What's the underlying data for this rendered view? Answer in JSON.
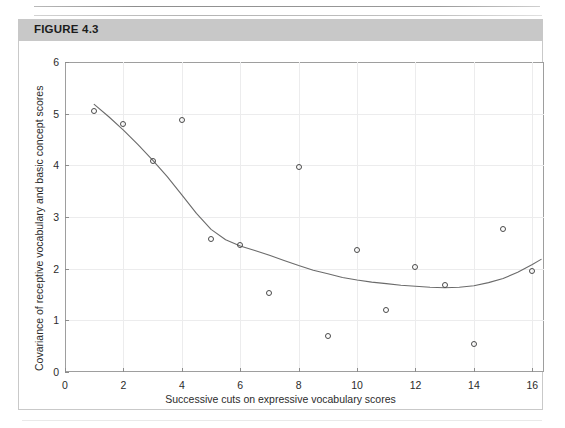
{
  "figure": {
    "label": "FIGURE 4.3",
    "band_color": "#c8c8c8"
  },
  "chart_data": {
    "type": "scatter",
    "title": "FIGURE 4.3",
    "xlabel": "Successive cuts on expressive vocabulary scores",
    "ylabel": "Covariance of receptive vocabulary and basic concept scores",
    "xlim": [
      0,
      16.4
    ],
    "ylim": [
      0,
      6
    ],
    "xticks": [
      0,
      2,
      4,
      6,
      8,
      10,
      12,
      14,
      16
    ],
    "xtick_labels": [
      "0",
      "2",
      "4",
      "6",
      "8",
      "10",
      "12",
      "14",
      "16"
    ],
    "yticks": [
      0,
      1,
      2,
      3,
      4,
      5,
      6
    ],
    "ytick_labels": [
      "0",
      "1",
      "2",
      "3",
      "4",
      "5",
      "6"
    ],
    "grid": true,
    "legend": null,
    "marker": "open-circle",
    "marker_color": "#4a4a4a",
    "line_color": "#6b6b6b",
    "x": [
      1,
      2,
      3,
      4,
      5,
      6,
      7,
      8,
      9,
      10,
      11,
      12,
      13,
      14,
      15,
      16
    ],
    "values": [
      5.05,
      4.8,
      4.08,
      4.87,
      2.58,
      2.45,
      1.52,
      3.97,
      0.7,
      2.37,
      1.2,
      2.03,
      1.68,
      0.55,
      2.77,
      1.95
    ],
    "series": [
      {
        "name": "Covariance by successive cut",
        "values": [
          5.05,
          4.8,
          4.08,
          4.87,
          2.58,
          2.45,
          1.52,
          3.97,
          0.7,
          2.37,
          1.2,
          2.03,
          1.68,
          0.55,
          2.77,
          1.95
        ]
      },
      {
        "name": "Smoothed fit",
        "type": "line",
        "x": [
          1.0,
          1.5,
          2.0,
          2.5,
          3.0,
          3.5,
          4.0,
          4.5,
          5.0,
          5.5,
          6.0,
          6.5,
          7.0,
          7.5,
          8.0,
          8.5,
          9.0,
          9.5,
          10.0,
          10.5,
          11.0,
          11.5,
          12.0,
          12.5,
          13.0,
          13.5,
          14.0,
          14.5,
          15.0,
          15.5,
          16.0,
          16.3
        ],
        "values": [
          5.18,
          4.94,
          4.68,
          4.4,
          4.1,
          3.78,
          3.43,
          3.07,
          2.76,
          2.56,
          2.44,
          2.35,
          2.26,
          2.16,
          2.06,
          1.97,
          1.9,
          1.83,
          1.78,
          1.74,
          1.71,
          1.68,
          1.66,
          1.64,
          1.63,
          1.64,
          1.67,
          1.73,
          1.81,
          1.93,
          2.08,
          2.18
        ]
      }
    ]
  }
}
